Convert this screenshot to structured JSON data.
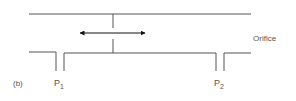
{
  "diagram": {
    "panel_label": "(b)",
    "orifice_label": "Orifice",
    "p1": {
      "base": "P",
      "sub": "1"
    },
    "p2": {
      "base": "P",
      "sub": "2"
    },
    "arrow": "bidirectional-arrow",
    "colors": {
      "line": "#555555",
      "arrow": "#111111",
      "text": "#555555"
    }
  }
}
